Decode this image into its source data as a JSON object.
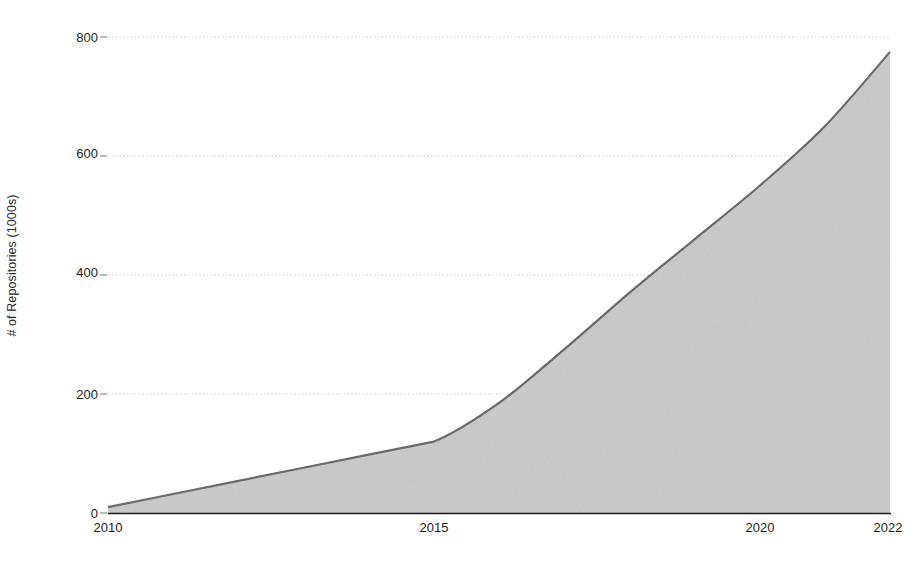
{
  "chart_data": {
    "type": "area",
    "title": "",
    "subtitle": "",
    "xlabel": "",
    "ylabel": "# of Repositories (1000s)",
    "x": [
      2010,
      2011,
      2012,
      2013,
      2014,
      2015,
      2016,
      2017,
      2018,
      2019,
      2020,
      2021,
      2022
    ],
    "values": [
      10,
      32,
      54,
      76,
      98,
      120,
      185,
      275,
      370,
      460,
      550,
      650,
      775
    ],
    "series": [
      {
        "name": "# of Repositories (1000s)",
        "values": [
          10,
          32,
          54,
          76,
          98,
          120,
          185,
          275,
          370,
          460,
          550,
          650,
          775
        ]
      }
    ],
    "xlim": [
      2010,
      2022
    ],
    "ylim": [
      0,
      800
    ],
    "xticks": [
      2010,
      2015,
      2020,
      2022
    ],
    "xtick_labels": [
      "2010",
      "2015",
      "2020",
      "2022"
    ],
    "yticks": [
      0,
      200,
      400,
      600,
      800
    ],
    "ytick_labels": [
      "0",
      "200",
      "400",
      "600",
      "800"
    ],
    "grid": "horizontal-dotted",
    "legend": "none",
    "fill_color": "#c9c9c9",
    "line_color": "#6a6a6a",
    "axis_color": "#1a1a1a",
    "grid_color": "#b9b9b9",
    "text_color": "#1d1d1d",
    "annotations": []
  },
  "axes": {
    "y_title": "# of Repositories (1000s)",
    "y_ticks": [
      {
        "label": "800",
        "value": 800
      },
      {
        "label": "600",
        "value": 600
      },
      {
        "label": "400",
        "value": 400
      },
      {
        "label": "200",
        "value": 200
      },
      {
        "label": "0",
        "value": 0
      }
    ],
    "x_ticks": [
      {
        "label": "2010",
        "value": 2010
      },
      {
        "label": "2015",
        "value": 2015
      },
      {
        "label": "2020",
        "value": 2020
      },
      {
        "label": "2022",
        "value": 2022
      }
    ]
  }
}
